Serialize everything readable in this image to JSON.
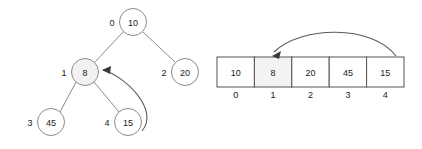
{
  "figure": {
    "type": "binary-heap-array-correspondence",
    "background_color": "#ffffff",
    "stroke_color": "#8a8a8a",
    "highlight_color": "#f2f2f2",
    "text_color": "#1a1a1a"
  },
  "tree": {
    "label": "binary tree diagram",
    "nodes": [
      {
        "id": "n0",
        "value": "10",
        "index": "0",
        "cx": 133,
        "cy": 22,
        "r": 13.5,
        "highlighted": false
      },
      {
        "id": "n1",
        "value": "8",
        "index": "1",
        "cx": 85,
        "cy": 72,
        "r": 13.5,
        "highlighted": true
      },
      {
        "id": "n2",
        "value": "20",
        "index": "2",
        "cx": 185,
        "cy": 72,
        "r": 13.5,
        "highlighted": false
      },
      {
        "id": "n3",
        "value": "45",
        "index": "3",
        "cx": 51,
        "cy": 122,
        "r": 13.5,
        "highlighted": false
      },
      {
        "id": "n4",
        "value": "15",
        "index": "4",
        "cx": 128,
        "cy": 122,
        "r": 13.5,
        "highlighted": false
      }
    ],
    "edges": [
      {
        "from": "n0",
        "to": "n1"
      },
      {
        "from": "n0",
        "to": "n2"
      },
      {
        "from": "n1",
        "to": "n3"
      },
      {
        "from": "n1",
        "to": "n4"
      }
    ],
    "swap_arrow": {
      "label": "swap arrow from node 15 to node 8",
      "from_value": "15",
      "to_value": "8",
      "path": "M 142 131 C 160 110 125 76 103 70",
      "head": "102,70 111,66 110,74"
    }
  },
  "array": {
    "label": "array representation",
    "left": 217,
    "top": 57,
    "cell_width": 37.4,
    "cell_height": 30,
    "index_row_y": 95,
    "cells": [
      {
        "value": "10",
        "index": "0",
        "highlighted": false
      },
      {
        "value": "8",
        "index": "1",
        "highlighted": true
      },
      {
        "value": "20",
        "index": "2",
        "highlighted": false
      },
      {
        "value": "45",
        "index": "3",
        "highlighted": false
      },
      {
        "value": "15",
        "index": "4",
        "highlighted": false
      }
    ],
    "swap_arrow": {
      "label": "swap arrow from array index 4 to array index 1",
      "from_index": "4",
      "to_index": "1",
      "path": "M 396 56 C 372 24 300 26 274 52",
      "head": "272,56 281,51 279,59"
    }
  }
}
